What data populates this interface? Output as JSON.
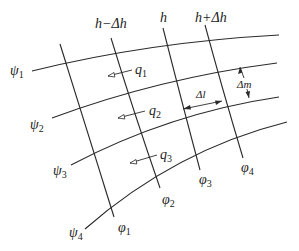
{
  "diagram": {
    "head_labels": {
      "h_minus": "h−Δh",
      "h": "h",
      "h_plus": "h+Δh"
    },
    "streamlines": [
      {
        "name": "ψ",
        "sub": "1"
      },
      {
        "name": "ψ",
        "sub": "2"
      },
      {
        "name": "ψ",
        "sub": "3"
      },
      {
        "name": "ψ",
        "sub": "4"
      }
    ],
    "equipotentials": [
      {
        "name": "φ",
        "sub": "1"
      },
      {
        "name": "φ",
        "sub": "2"
      },
      {
        "name": "φ",
        "sub": "3"
      },
      {
        "name": "φ",
        "sub": "4"
      }
    ],
    "flows": [
      {
        "name": "q",
        "sub": "1"
      },
      {
        "name": "q",
        "sub": "2"
      },
      {
        "name": "q",
        "sub": "3"
      }
    ],
    "dimensions": {
      "delta_l": "Δl",
      "delta_m": "Δm"
    },
    "colors": {
      "line": "#2a2a2a",
      "background": "#ffffff"
    }
  }
}
